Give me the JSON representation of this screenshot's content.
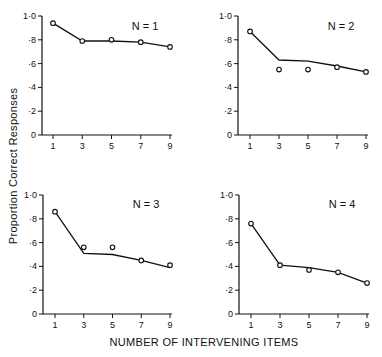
{
  "chart_data": {
    "type": "line",
    "layout": "2x2 small multiples",
    "xlabel": "NUMBER OF INTERVENING ITEMS",
    "ylabel": "Proportion Correct Responses",
    "x_ticks": [
      1,
      3,
      5,
      7,
      9
    ],
    "y_ticks": [
      0,
      0.2,
      0.4,
      0.6,
      0.8,
      1.0
    ],
    "y_tick_labels": [
      "0",
      "·2",
      "·4",
      "·6",
      "·8",
      "1·0"
    ],
    "ylim": [
      0,
      1.0
    ],
    "xlim": [
      0,
      9
    ],
    "grid": false,
    "legend": "none",
    "panels": [
      {
        "title": "N = 1",
        "x": [
          1,
          3,
          5,
          7,
          9
        ],
        "series": [
          {
            "name": "predicted",
            "style": "line",
            "values": [
              0.94,
              0.79,
              0.79,
              0.78,
              0.74
            ]
          },
          {
            "name": "observed",
            "style": "open-circle",
            "values": [
              0.94,
              0.79,
              0.8,
              0.78,
              0.74
            ]
          }
        ]
      },
      {
        "title": "N = 2",
        "x": [
          1,
          3,
          5,
          7,
          9
        ],
        "series": [
          {
            "name": "predicted",
            "style": "line",
            "values": [
              0.87,
              0.63,
              0.62,
              0.58,
              0.53
            ]
          },
          {
            "name": "observed",
            "style": "open-circle",
            "values": [
              0.87,
              0.55,
              0.55,
              0.57,
              0.53
            ]
          }
        ]
      },
      {
        "title": "N = 3",
        "x": [
          1,
          3,
          5,
          7,
          9
        ],
        "series": [
          {
            "name": "predicted",
            "style": "line",
            "values": [
              0.86,
              0.51,
              0.5,
              0.45,
              0.39
            ]
          },
          {
            "name": "observed",
            "style": "open-circle",
            "values": [
              0.86,
              0.56,
              0.56,
              0.45,
              0.41
            ]
          }
        ]
      },
      {
        "title": "N = 4",
        "x": [
          1,
          3,
          5,
          7,
          9
        ],
        "series": [
          {
            "name": "predicted",
            "style": "line",
            "values": [
              0.76,
              0.41,
              0.39,
              0.35,
              0.26
            ]
          },
          {
            "name": "observed",
            "style": "open-circle",
            "values": [
              0.76,
              0.41,
              0.37,
              0.35,
              0.26
            ]
          }
        ]
      }
    ]
  },
  "colors": {
    "ink": "#111111",
    "background": "#ffffff"
  }
}
